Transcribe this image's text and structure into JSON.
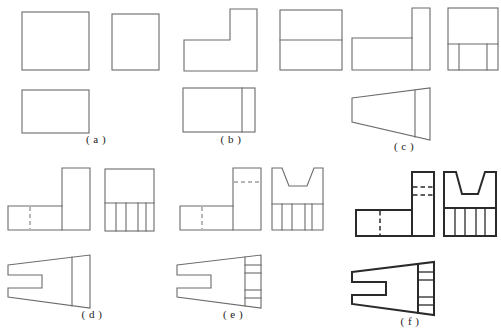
{
  "page": {
    "kind": "engineering-drawing-exercise-sheet",
    "width": 501,
    "height": 336,
    "background": "#ffffff",
    "line_color_thin": "#6b6b6b",
    "line_color_bold": "#2a2a2a",
    "hidden_line_style": "dashed"
  },
  "figures": [
    {
      "id": "a",
      "label": "( a )",
      "label_x": 96,
      "label_y": 140,
      "views": [
        {
          "name": "front-view",
          "type": "rectangle",
          "x": 22,
          "y": 12,
          "w": 67,
          "h": 58
        },
        {
          "name": "left-side-view",
          "type": "rectangle",
          "x": 112,
          "y": 14,
          "w": 47,
          "h": 56
        },
        {
          "name": "top-view",
          "type": "rectangle",
          "x": 22,
          "y": 90,
          "w": 67,
          "h": 43
        }
      ]
    },
    {
      "id": "b",
      "label": "( b )",
      "label_x": 231,
      "label_y": 140,
      "views": [
        {
          "name": "front-view",
          "type": "L-shape",
          "x": 184,
          "y": 9,
          "w": 73,
          "h": 62
        },
        {
          "name": "left-side-view",
          "type": "rectangle-split-horizontal",
          "x": 280,
          "y": 10,
          "w": 62,
          "h": 60
        },
        {
          "name": "top-view",
          "type": "rectangle-split-vertical",
          "x": 183,
          "y": 88,
          "w": 72,
          "h": 44
        }
      ]
    },
    {
      "id": "c",
      "label": "( c )",
      "label_x": 404,
      "label_y": 146,
      "views": [
        {
          "name": "front-view",
          "type": "L-shape-flipped",
          "x": 352,
          "y": 8,
          "w": 72,
          "h": 62
        },
        {
          "name": "left-side-view",
          "type": "rectangle-split-with-ribs",
          "x": 448,
          "y": 8,
          "w": 50,
          "h": 62
        },
        {
          "name": "top-view",
          "type": "trapezoid-plain",
          "x": 352,
          "y": 88,
          "w": 78,
          "h": 52
        }
      ]
    },
    {
      "id": "d",
      "label": "( d )",
      "label_x": 92,
      "label_y": 316,
      "views": [
        {
          "name": "front-view",
          "type": "L-shape-hidden",
          "x": 16,
          "y": 168,
          "w": 74,
          "h": 62
        },
        {
          "name": "left-side-view",
          "type": "rectangle-with-ribs",
          "x": 105,
          "y": 169,
          "w": 49,
          "h": 62
        },
        {
          "name": "top-view",
          "type": "trapezoid-slotted",
          "x": 8,
          "y": 255,
          "w": 82,
          "h": 55
        }
      ]
    },
    {
      "id": "e",
      "label": "( e )",
      "label_x": 233,
      "label_y": 316,
      "views": [
        {
          "name": "front-view",
          "type": "L-shape-hidden-top",
          "x": 180,
          "y": 168,
          "w": 74,
          "h": 62
        },
        {
          "name": "left-side-view",
          "type": "vee-notch-with-ribs",
          "x": 272,
          "y": 168,
          "w": 51,
          "h": 62
        },
        {
          "name": "top-view",
          "type": "trapezoid-slotted-banded",
          "x": 172,
          "y": 255,
          "w": 82,
          "h": 55
        }
      ]
    },
    {
      "id": "f",
      "label": "( f )",
      "label_x": 410,
      "label_y": 320,
      "views": [
        {
          "name": "front-view",
          "type": "L-shape-hidden-bold",
          "x": 356,
          "y": 172,
          "w": 76,
          "h": 64
        },
        {
          "name": "left-side-view",
          "type": "vee-notch-with-ribs-bold",
          "x": 444,
          "y": 172,
          "w": 52,
          "h": 64
        },
        {
          "name": "top-view",
          "type": "trapezoid-slotted-banded-bold",
          "x": 352,
          "y": 262,
          "w": 84,
          "h": 55
        }
      ]
    }
  ]
}
